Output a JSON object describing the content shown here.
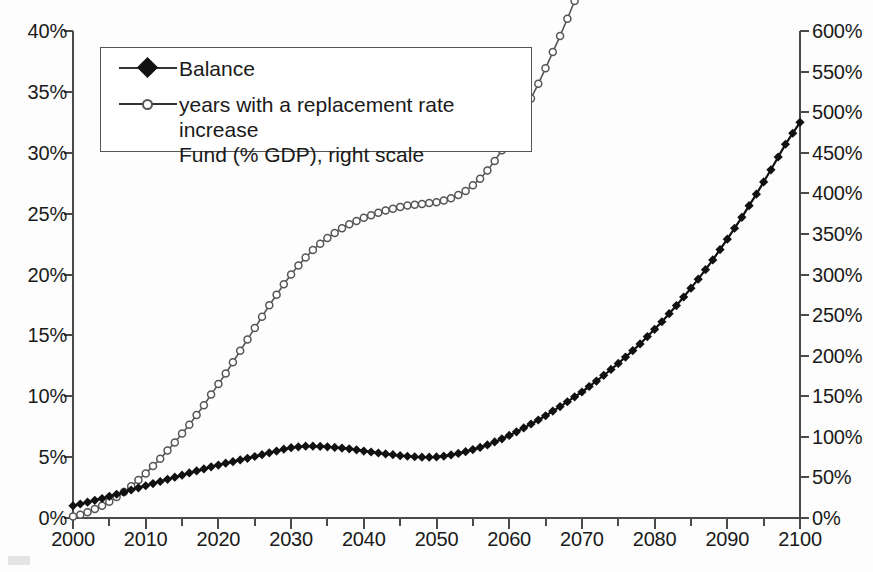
{
  "chart_data": {
    "type": "line",
    "title": "",
    "subtitle": "",
    "xlabel": "",
    "ylabel": "",
    "grid": false,
    "legend_position": "top-left",
    "x": [
      2000,
      2001,
      2002,
      2003,
      2004,
      2005,
      2006,
      2007,
      2008,
      2009,
      2010,
      2011,
      2012,
      2013,
      2014,
      2015,
      2016,
      2017,
      2018,
      2019,
      2020,
      2021,
      2022,
      2023,
      2024,
      2025,
      2026,
      2027,
      2028,
      2029,
      2030,
      2031,
      2032,
      2033,
      2034,
      2035,
      2036,
      2037,
      2038,
      2039,
      2040,
      2041,
      2042,
      2043,
      2044,
      2045,
      2046,
      2047,
      2048,
      2049,
      2050,
      2051,
      2052,
      2053,
      2054,
      2055,
      2056,
      2057,
      2058,
      2059,
      2060,
      2061,
      2062,
      2063,
      2064,
      2065,
      2066,
      2067,
      2068,
      2069,
      2070,
      2071,
      2072,
      2073,
      2074,
      2075,
      2076,
      2077,
      2078,
      2079,
      2080,
      2081,
      2082,
      2083,
      2084,
      2085,
      2086,
      2087,
      2088,
      2089,
      2090,
      2091,
      2092,
      2093,
      2094,
      2095,
      2096,
      2097,
      2098,
      2099,
      2100
    ],
    "xlim": [
      2000,
      2100
    ],
    "xticks": [
      2000,
      2010,
      2020,
      2030,
      2040,
      2050,
      2060,
      2070,
      2080,
      2090,
      2100
    ],
    "xtick_labels": [
      "2000",
      "2010",
      "2020",
      "2030",
      "2040",
      "2050",
      "2060",
      "2070",
      "2080",
      "2090",
      "2100"
    ],
    "x_minor_tick_step": 5,
    "left_axis": {
      "ylim": [
        0,
        40
      ],
      "yticks": [
        0,
        5,
        10,
        15,
        20,
        25,
        30,
        35,
        40
      ],
      "ytick_labels": [
        "0%",
        "5%",
        "10%",
        "15%",
        "20%",
        "25%",
        "30%",
        "35%",
        "40%"
      ],
      "unit": "%"
    },
    "right_axis": {
      "ylim": [
        0,
        600
      ],
      "yticks": [
        0,
        50,
        100,
        150,
        200,
        250,
        300,
        350,
        400,
        450,
        500,
        550,
        600
      ],
      "ytick_labels": [
        "0%",
        "50%",
        "100%",
        "150%",
        "200%",
        "250%",
        "300%",
        "350%",
        "400%",
        "450%",
        "500%",
        "550%",
        "600%"
      ],
      "unit": "%"
    },
    "series": [
      {
        "name": "Balance",
        "axis": "left",
        "marker": "filled-diamond",
        "color": "#111111",
        "values": [
          1.0,
          1.15,
          1.3,
          1.45,
          1.6,
          1.78,
          1.95,
          2.12,
          2.3,
          2.48,
          2.65,
          2.83,
          3.0,
          3.18,
          3.35,
          3.52,
          3.7,
          3.87,
          4.03,
          4.2,
          4.35,
          4.5,
          4.63,
          4.77,
          4.9,
          5.05,
          5.2,
          5.35,
          5.5,
          5.65,
          5.78,
          5.85,
          5.9,
          5.9,
          5.88,
          5.85,
          5.8,
          5.74,
          5.68,
          5.6,
          5.5,
          5.42,
          5.34,
          5.26,
          5.2,
          5.12,
          5.07,
          5.03,
          5.0,
          5.0,
          5.02,
          5.08,
          5.18,
          5.3,
          5.45,
          5.62,
          5.8,
          6.0,
          6.25,
          6.5,
          6.78,
          7.08,
          7.4,
          7.72,
          8.05,
          8.4,
          8.78,
          9.15,
          9.55,
          9.95,
          10.35,
          10.8,
          11.25,
          11.72,
          12.2,
          12.7,
          13.22,
          13.75,
          14.3,
          14.9,
          15.5,
          16.12,
          16.78,
          17.45,
          18.15,
          18.88,
          19.62,
          20.4,
          21.2,
          22.05,
          22.9,
          23.8,
          24.7,
          25.65,
          26.6,
          27.6,
          28.6,
          29.65,
          30.7,
          31.6,
          32.5
        ]
      },
      {
        "name": "years with a replacement rate increase Fund (% GDP), right scale",
        "axis": "right",
        "marker": "open-circle",
        "color": "#555555",
        "values": [
          2,
          4,
          7,
          11,
          15,
          20,
          26,
          32,
          39,
          47,
          55,
          64,
          73,
          83,
          93,
          104,
          115,
          127,
          139,
          152,
          165,
          178,
          192,
          206,
          220,
          234,
          248,
          262,
          275,
          288,
          300,
          311,
          321,
          330,
          338,
          345,
          351,
          357,
          362,
          366,
          370,
          373,
          376,
          379,
          381,
          383,
          385,
          386,
          387,
          388,
          389,
          391,
          394,
          398,
          403,
          410,
          418,
          428,
          440,
          453,
          468,
          484,
          500,
          517,
          535,
          554,
          574,
          594,
          615,
          637,
          660,
          684,
          709,
          735,
          761,
          789,
          817,
          846,
          877,
          908,
          940,
          973,
          1007,
          1042,
          1078,
          1115,
          1153,
          1192,
          1232,
          1273,
          1315,
          1358,
          1402,
          1447,
          1493,
          1540,
          1588,
          1637,
          1687,
          1738,
          1790
        ],
        "values_right_scale": [
          2,
          4,
          7,
          11,
          15,
          20,
          26,
          32,
          39,
          47,
          55,
          64,
          73,
          83,
          93,
          104,
          115,
          127,
          139,
          152,
          165,
          178,
          192,
          206,
          220,
          234,
          248,
          262,
          275,
          288,
          300,
          311,
          321,
          330,
          338,
          345,
          351,
          357,
          362,
          366,
          370,
          373,
          376,
          379,
          381,
          383,
          385,
          386,
          387,
          388,
          389,
          391,
          394,
          398,
          403,
          410,
          418,
          428,
          440,
          453,
          468,
          484,
          500,
          517,
          535,
          554,
          574,
          594,
          615,
          637,
          660,
          684,
          709,
          735,
          761,
          789,
          817,
          846,
          877,
          908,
          940,
          973,
          1007,
          1042,
          1078,
          1115,
          1153,
          1192,
          1232,
          1273,
          1315,
          1358,
          1402,
          1447,
          1493,
          1540,
          1588,
          1637,
          1687,
          1738,
          1790
        ]
      }
    ]
  },
  "legend": {
    "items": [
      {
        "label": "Balance",
        "marker": "filled-diamond"
      },
      {
        "label": "years with a replacement rate increase\nFund (% GDP), right scale",
        "marker": "open-circle"
      }
    ]
  }
}
